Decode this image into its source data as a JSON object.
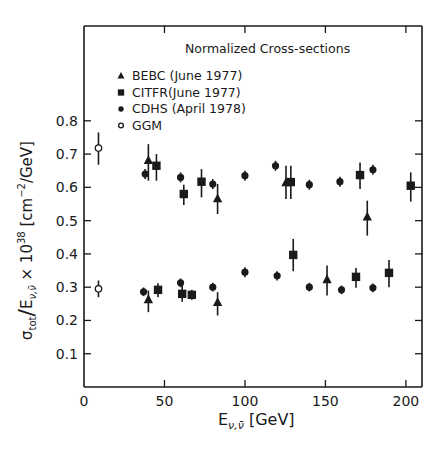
{
  "chart_data": {
    "type": "scatter",
    "title": "Normalized Cross-sections",
    "xlabel": "E_{ν,ν̄} [GeV]",
    "xlabel_main": "E",
    "xlabel_sub": "ν,ν̄",
    "xlabel_unit": "[GeV]",
    "ylabel": "σ_tot / E_{ν,ν̄} × 10^38 [cm^-2/GeV]",
    "ylabel_parts": {
      "sigma": "σ",
      "tot": "tot",
      "slash": "/",
      "E": "E",
      "nu_sub": "ν,ν̄",
      "times": " × 10",
      "exp38": "38",
      "unit_open": " [cm",
      "unit_exp": "−2",
      "unit_close": "/GeV]"
    },
    "xlim": [
      0,
      210
    ],
    "ylim": [
      0,
      1.085
    ],
    "x_ticks": [
      0,
      50,
      100,
      150,
      200
    ],
    "x_tick_labels": [
      "0",
      "50",
      "100",
      "150",
      "200"
    ],
    "y_ticks": [
      0.1,
      0.2,
      0.3,
      0.4,
      0.5,
      0.6,
      0.7,
      0.8
    ],
    "y_tick_labels": [
      "0.1",
      "0.2",
      "0.3",
      "0.4",
      "0.5",
      "0.6",
      "0.7",
      "0.8"
    ],
    "grid": false,
    "legend_position": "upper-left-inside",
    "series": [
      {
        "name": "BEBC (June 1977)",
        "marker": "filled-triangle",
        "points": [
          {
            "x": 40,
            "y": 0.68,
            "err_lo": 0.62,
            "err_hi": 0.73
          },
          {
            "x": 83,
            "y": 0.565,
            "err_lo": 0.52,
            "err_hi": 0.61
          },
          {
            "x": 125.5,
            "y": 0.613,
            "err_lo": 0.565,
            "err_hi": 0.665
          },
          {
            "x": 176,
            "y": 0.51,
            "err_lo": 0.455,
            "err_hi": 0.56
          },
          {
            "x": 40,
            "y": 0.262,
            "err_lo": 0.225,
            "err_hi": 0.29
          },
          {
            "x": 83,
            "y": 0.253,
            "err_lo": 0.215,
            "err_hi": 0.285
          },
          {
            "x": 151,
            "y": 0.322,
            "err_lo": 0.275,
            "err_hi": 0.365
          }
        ]
      },
      {
        "name": "CITFR (June 1977)",
        "marker": "filled-square",
        "points": [
          {
            "x": 45,
            "y": 0.665,
            "err_lo": 0.62,
            "err_hi": 0.7
          },
          {
            "x": 62,
            "y": 0.58,
            "err_lo": 0.547,
            "err_hi": 0.608
          },
          {
            "x": 73,
            "y": 0.617,
            "err_lo": 0.57,
            "err_hi": 0.655
          },
          {
            "x": 128.5,
            "y": 0.616,
            "err_lo": 0.565,
            "err_hi": 0.665
          },
          {
            "x": 171.5,
            "y": 0.637,
            "err_lo": 0.595,
            "err_hi": 0.675
          },
          {
            "x": 203,
            "y": 0.605,
            "err_lo": 0.557,
            "err_hi": 0.645
          },
          {
            "x": 46,
            "y": 0.292,
            "err_lo": 0.27,
            "err_hi": 0.312
          },
          {
            "x": 61,
            "y": 0.28,
            "err_lo": 0.256,
            "err_hi": 0.304
          },
          {
            "x": 67,
            "y": 0.277,
            "err_lo": 0.262,
            "err_hi": 0.292
          },
          {
            "x": 130,
            "y": 0.397,
            "err_lo": 0.348,
            "err_hi": 0.445
          },
          {
            "x": 169,
            "y": 0.331,
            "err_lo": 0.298,
            "err_hi": 0.358
          },
          {
            "x": 189.5,
            "y": 0.343,
            "err_lo": 0.3,
            "err_hi": 0.382
          }
        ]
      },
      {
        "name": "CDHS (April 1978)",
        "marker": "filled-circle",
        "points": [
          {
            "x": 38,
            "y": 0.64,
            "err_lo": 0.625,
            "err_hi": 0.655
          },
          {
            "x": 60,
            "y": 0.63,
            "err_lo": 0.615,
            "err_hi": 0.645
          },
          {
            "x": 80,
            "y": 0.61,
            "err_lo": 0.595,
            "err_hi": 0.625
          },
          {
            "x": 100,
            "y": 0.635,
            "err_lo": 0.62,
            "err_hi": 0.65
          },
          {
            "x": 119,
            "y": 0.665,
            "err_lo": 0.65,
            "err_hi": 0.68
          },
          {
            "x": 140,
            "y": 0.608,
            "err_lo": 0.593,
            "err_hi": 0.623
          },
          {
            "x": 159,
            "y": 0.617,
            "err_lo": 0.602,
            "err_hi": 0.632
          },
          {
            "x": 179.5,
            "y": 0.653,
            "err_lo": 0.638,
            "err_hi": 0.668
          },
          {
            "x": 37,
            "y": 0.286,
            "err_lo": 0.273,
            "err_hi": 0.299
          },
          {
            "x": 60,
            "y": 0.313,
            "err_lo": 0.3,
            "err_hi": 0.326
          },
          {
            "x": 80,
            "y": 0.3,
            "err_lo": 0.287,
            "err_hi": 0.313
          },
          {
            "x": 100,
            "y": 0.345,
            "err_lo": 0.33,
            "err_hi": 0.36
          },
          {
            "x": 120,
            "y": 0.334,
            "err_lo": 0.32,
            "err_hi": 0.348
          },
          {
            "x": 140,
            "y": 0.3,
            "err_lo": 0.287,
            "err_hi": 0.313
          },
          {
            "x": 160,
            "y": 0.292,
            "err_lo": 0.279,
            "err_hi": 0.305
          },
          {
            "x": 179.5,
            "y": 0.298,
            "err_lo": 0.285,
            "err_hi": 0.311
          }
        ]
      },
      {
        "name": "GGM",
        "marker": "open-circle",
        "points": [
          {
            "x": 9,
            "y": 0.718,
            "err_lo": 0.668,
            "err_hi": 0.765
          },
          {
            "x": 9,
            "y": 0.295,
            "err_lo": 0.27,
            "err_hi": 0.32
          }
        ]
      }
    ]
  },
  "legend": {
    "title": "Normalized Cross-sections",
    "items": [
      {
        "label": "BEBC (June 1977)",
        "marker": "filled-triangle"
      },
      {
        "label": "CITFR(June 1977)",
        "marker": "filled-square"
      },
      {
        "label": "CDHS (April 1978)",
        "marker": "filled-circle"
      },
      {
        "label": "GGM",
        "marker": "open-circle"
      }
    ]
  },
  "colors": {
    "ink": "#1a1a1a",
    "background": "#ffffff"
  }
}
